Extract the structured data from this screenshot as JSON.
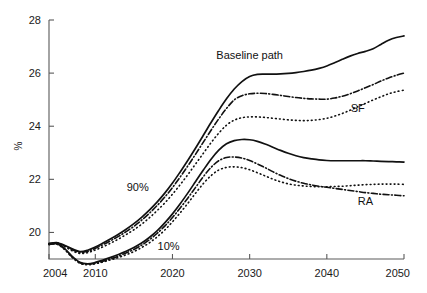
{
  "chart_data": {
    "type": "line",
    "title": "",
    "xlabel": "",
    "ylabel": "%",
    "xlim": [
      2004,
      2050
    ],
    "ylim": [
      19.0,
      28.0
    ],
    "xticks": [
      2004,
      2010,
      2020,
      2030,
      2040,
      2050
    ],
    "yticks": [
      20,
      22,
      24,
      26,
      28
    ],
    "ytick_labels": [
      "20",
      "22",
      "24",
      "26",
      "28"
    ],
    "xtick_labels": [
      "2004",
      "2010",
      "2020",
      "2030",
      "2040",
      "2050"
    ],
    "grid": false,
    "legend_position": "inline-annotations",
    "annotations": [
      {
        "text": "Baseline path",
        "x": 2030,
        "y": 26.55
      },
      {
        "text": "SF",
        "x": 2044,
        "y": 24.55
      },
      {
        "text": "RA",
        "x": 2045,
        "y": 21.05
      },
      {
        "text": "90%",
        "x": 2015.5,
        "y": 21.55
      },
      {
        "text": "10%",
        "x": 2019.5,
        "y": 19.35
      }
    ],
    "x": [
      2004,
      2005,
      2006,
      2007,
      2008,
      2009,
      2010,
      2011,
      2012,
      2013,
      2014,
      2015,
      2016,
      2017,
      2018,
      2019,
      2020,
      2021,
      2022,
      2023,
      2024,
      2025,
      2026,
      2027,
      2028,
      2029,
      2030,
      2031,
      2032,
      2033,
      2034,
      2035,
      2036,
      2037,
      2038,
      2039,
      2040,
      2041,
      2042,
      2043,
      2044,
      2045,
      2046,
      2047,
      2048,
      2049,
      2050
    ],
    "series": [
      {
        "name": "Baseline path 90%",
        "style": "solid",
        "values": [
          19.58,
          19.62,
          19.52,
          19.38,
          19.28,
          19.33,
          19.45,
          19.6,
          19.76,
          19.93,
          20.12,
          20.33,
          20.57,
          20.84,
          21.14,
          21.48,
          21.86,
          22.28,
          22.72,
          23.18,
          23.66,
          24.14,
          24.6,
          25.03,
          25.4,
          25.68,
          25.87,
          25.95,
          25.96,
          25.96,
          25.97,
          25.99,
          26.02,
          26.06,
          26.11,
          26.18,
          26.27,
          26.39,
          26.52,
          26.64,
          26.74,
          26.82,
          26.92,
          27.08,
          27.24,
          27.34,
          27.4
        ]
      },
      {
        "name": "SF 90%",
        "style": "dash-dot",
        "values": [
          19.58,
          19.61,
          19.5,
          19.35,
          19.25,
          19.29,
          19.4,
          19.54,
          19.69,
          19.85,
          20.03,
          20.23,
          20.46,
          20.72,
          21.01,
          21.33,
          21.69,
          22.09,
          22.51,
          22.95,
          23.4,
          23.85,
          24.28,
          24.67,
          24.99,
          25.15,
          25.22,
          25.24,
          25.23,
          25.2,
          25.16,
          25.12,
          25.08,
          25.05,
          25.03,
          25.02,
          25.02,
          25.06,
          25.13,
          25.22,
          25.33,
          25.45,
          25.57,
          25.7,
          25.82,
          25.92,
          26.0
        ]
      },
      {
        "name": "RA 90%",
        "style": "dotted",
        "values": [
          19.58,
          19.59,
          19.47,
          19.31,
          19.21,
          19.24,
          19.34,
          19.46,
          19.6,
          19.75,
          19.92,
          20.1,
          20.31,
          20.55,
          20.82,
          21.11,
          21.44,
          21.8,
          22.18,
          22.58,
          22.98,
          23.38,
          23.74,
          24.04,
          24.23,
          24.32,
          24.35,
          24.35,
          24.33,
          24.3,
          24.27,
          24.24,
          24.22,
          24.21,
          24.22,
          24.25,
          24.3,
          24.38,
          24.48,
          24.6,
          24.73,
          24.86,
          24.99,
          25.11,
          25.22,
          25.3,
          25.36
        ]
      },
      {
        "name": "Baseline path 10%",
        "style": "solid",
        "values": [
          19.55,
          19.58,
          19.4,
          19.1,
          18.88,
          18.82,
          18.87,
          18.96,
          19.06,
          19.17,
          19.29,
          19.43,
          19.6,
          19.81,
          20.06,
          20.36,
          20.7,
          21.08,
          21.49,
          21.92,
          22.35,
          22.76,
          23.1,
          23.34,
          23.46,
          23.5,
          23.49,
          23.43,
          23.33,
          23.21,
          23.09,
          22.98,
          22.89,
          22.82,
          22.77,
          22.73,
          22.71,
          22.7,
          22.7,
          22.7,
          22.7,
          22.7,
          22.69,
          22.68,
          22.67,
          22.66,
          22.65
        ]
      },
      {
        "name": "SF 10%",
        "style": "dash-dot",
        "values": [
          19.55,
          19.57,
          19.38,
          19.08,
          18.86,
          18.8,
          18.84,
          18.92,
          19.01,
          19.11,
          19.23,
          19.36,
          19.52,
          19.72,
          19.96,
          20.24,
          20.56,
          20.92,
          21.3,
          21.7,
          22.1,
          22.45,
          22.7,
          22.82,
          22.84,
          22.8,
          22.71,
          22.58,
          22.44,
          22.29,
          22.15,
          22.03,
          21.93,
          21.85,
          21.79,
          21.74,
          21.7,
          21.66,
          21.62,
          21.58,
          21.54,
          21.5,
          21.47,
          21.44,
          21.42,
          21.4,
          21.38
        ]
      },
      {
        "name": "RA 10%",
        "style": "dotted",
        "values": [
          19.55,
          19.56,
          19.36,
          19.06,
          18.84,
          18.78,
          18.82,
          18.89,
          18.97,
          19.06,
          19.16,
          19.28,
          19.43,
          19.61,
          19.83,
          20.09,
          20.4,
          20.74,
          21.1,
          21.48,
          21.84,
          22.14,
          22.35,
          22.45,
          22.47,
          22.44,
          22.36,
          22.25,
          22.13,
          22.01,
          21.91,
          21.83,
          21.78,
          21.75,
          21.73,
          21.72,
          21.72,
          21.73,
          21.74,
          21.76,
          21.78,
          21.8,
          21.81,
          21.82,
          21.82,
          21.82,
          21.81
        ]
      }
    ]
  }
}
